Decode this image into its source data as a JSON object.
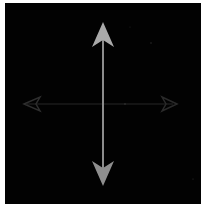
{
  "image": {
    "description": "Move cursor icon with bright vertical arrows and faint horizontal arrows on black background",
    "background_color": "#020202",
    "border_color": "#ffffff",
    "vertical_arrow_color": "#a8a8a8",
    "horizontal_arrow_color": "#2a2a2a",
    "icon": "move-cursor-icon"
  }
}
